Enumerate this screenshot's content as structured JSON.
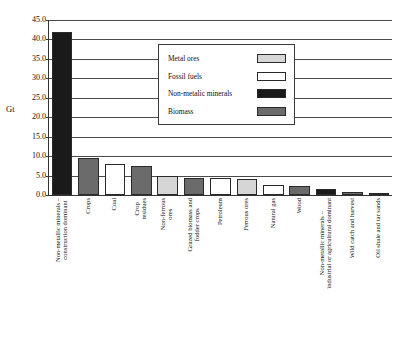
{
  "chart_data": {
    "type": "bar",
    "title": "",
    "xlabel": "",
    "ylabel": "Gt",
    "ylim": [
      0.0,
      45.0
    ],
    "ytick_step": 5.0,
    "ytick_labels": [
      "45.0",
      "40.0",
      "35.0",
      "30.0",
      "25.0",
      "20.0",
      "15.0",
      "10.0",
      "5.0",
      "0.0"
    ],
    "ytick_values": [
      45.0,
      40.0,
      35.0,
      30.0,
      25.0,
      20.0,
      15.0,
      10.0,
      5.0,
      0.0
    ],
    "grid": "horizontal",
    "legend_position": "upper-center",
    "categories": [
      "Non-metallic minerals – construction dominant",
      "Crops",
      "Coal",
      "Crop residues",
      "Non-ferrous ores",
      "Grazed biomass and fodder crops",
      "Petroleum",
      "Ferrous ores",
      "Natural gas",
      "Wood",
      "Non-metallic minerals – industrial or agricultural dominant",
      "Wild catch and harvest",
      "Oil shale and tar sands"
    ],
    "category_lines": [
      [
        "Non-metallic minerals –",
        "construction dominant"
      ],
      [
        "Crops"
      ],
      [
        "Coal"
      ],
      [
        "Crop",
        "residues"
      ],
      [
        "Non-ferrous",
        "ores"
      ],
      [
        "Grazed biomass and",
        "fodder crops"
      ],
      [
        "Petroleum"
      ],
      [
        "Ferrous ores"
      ],
      [
        "Natural gas"
      ],
      [
        "Wood"
      ],
      [
        "Non-metallic minerals –",
        "industrial or agricultural dominant"
      ],
      [
        "Wild catch and harvest"
      ],
      [
        "Oil shale and tar sands"
      ]
    ],
    "values": [
      42.0,
      9.4,
      8.0,
      7.5,
      5.0,
      4.5,
      4.3,
      4.0,
      2.6,
      2.2,
      1.5,
      0.9,
      0.5
    ],
    "groups": [
      "Non-metallic minerals",
      "Biomass",
      "Fossil fuels",
      "Biomass",
      "Metal ores",
      "Biomass",
      "Fossil fuels",
      "Metal ores",
      "Fossil fuels",
      "Biomass",
      "Non-metallic minerals",
      "Biomass",
      "Fossil fuels"
    ],
    "bar_colors": [
      "#1a1a1a",
      "#6b6b6b",
      "#ffffff",
      "#6b6b6b",
      "#d6d6d6",
      "#6b6b6b",
      "#ffffff",
      "#d6d6d6",
      "#ffffff",
      "#6b6b6b",
      "#1a1a1a",
      "#6b6b6b",
      "#ffffff"
    ],
    "series": [
      {
        "name": "Metal ores",
        "color": "#d6d6d6"
      },
      {
        "name": "Fossil fuels",
        "color": "#ffffff"
      },
      {
        "name": "Non-metalic minerals",
        "color": "#1a1a1a"
      },
      {
        "name": "Biomass",
        "color": "#6b6b6b"
      }
    ]
  },
  "legend": {
    "items": [
      {
        "label": "Metal ores",
        "color": "#d6d6d6"
      },
      {
        "label": "Fossil fuels",
        "color": "#ffffff"
      },
      {
        "label": "Non-metalic minerals",
        "color": "#1a1a1a"
      },
      {
        "label": "Biomass",
        "color": "#6b6b6b"
      }
    ]
  },
  "colors": {
    "metal_ores": "#d6d6d6",
    "fossil_fuels": "#ffffff",
    "non_metallic_minerals": "#1a1a1a",
    "biomass": "#6b6b6b",
    "axis": "#333333",
    "grid": "#4a4a4a",
    "background": "#ffffff"
  }
}
